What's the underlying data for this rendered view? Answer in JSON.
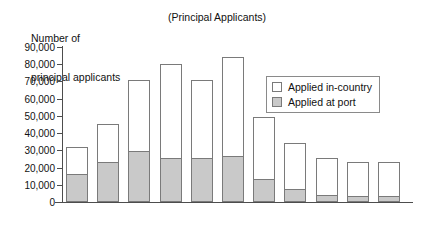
{
  "chart_data": {
    "type": "bar",
    "title": "",
    "subtitle": "(Principal Applicants)",
    "ylabel": "Number of\nprincipal applicants",
    "ylabel_line1": "Number of",
    "ylabel_line2": "principal applicants",
    "xlabel": "",
    "stacked": true,
    "grid": false,
    "legend_position": "inside-right",
    "ylim": [
      0,
      90000
    ],
    "ytick_values": [
      0,
      10000,
      20000,
      30000,
      40000,
      50000,
      60000,
      70000,
      80000,
      90000
    ],
    "ytick_labels": [
      "0",
      "10,000",
      "20,000",
      "30,000",
      "40,000",
      "50,000",
      "60,000",
      "70,000",
      "80,000",
      "90,000"
    ],
    "categories": [
      "1997",
      "1998",
      "1999",
      "2000",
      "2001",
      "2002",
      "2003",
      "2004",
      "2005",
      "2006",
      "2007"
    ],
    "series": [
      {
        "name": "Applied at port",
        "color": "#c9c9c9",
        "values": [
          16500,
          23000,
          29500,
          25800,
          25300,
          27000,
          13500,
          7600,
          4200,
          3300,
          3600
        ]
      },
      {
        "name": "Applied in-country",
        "color": "#ffffff",
        "values": [
          15700,
          22500,
          41500,
          54400,
          45500,
          57400,
          35700,
          26700,
          21300,
          20000,
          19900
        ]
      }
    ],
    "totals": [
      32200,
      45500,
      71000,
      80200,
      70800,
      84400,
      49200,
      34300,
      25500,
      23300,
      23500
    ]
  },
  "legend": {
    "items": [
      {
        "label": "Applied in-country",
        "swatch": "white-square-icon"
      },
      {
        "label": "Applied at port",
        "swatch": "gray-square-icon"
      }
    ]
  }
}
